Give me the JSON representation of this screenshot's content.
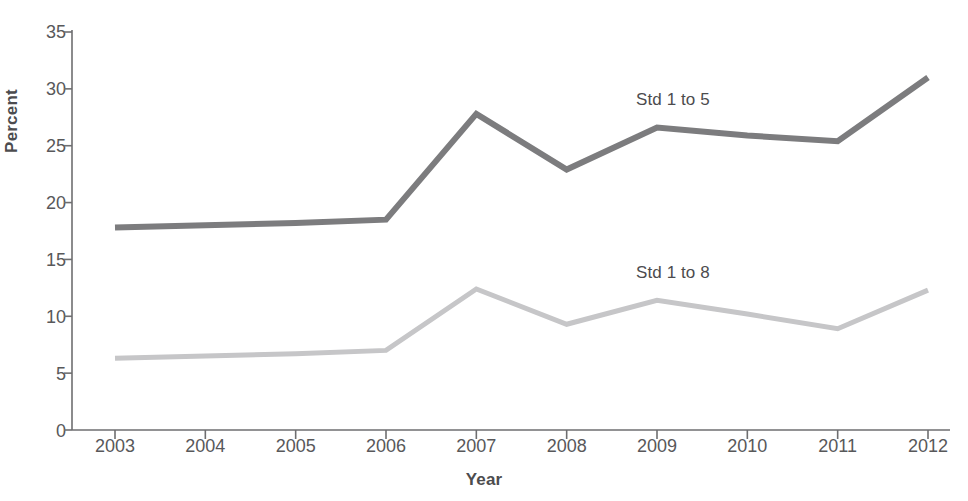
{
  "chart_data": {
    "type": "line",
    "title": "",
    "subtitle": "",
    "xlabel": "Year",
    "ylabel": "Percent",
    "x": [
      2003,
      2004,
      2005,
      2006,
      2007,
      2008,
      2009,
      2010,
      2011,
      2012
    ],
    "categories": [
      "2003",
      "2004",
      "2005",
      "2006",
      "2007",
      "2008",
      "2009",
      "2010",
      "2011",
      "2012"
    ],
    "xlim": [
      2003,
      2012
    ],
    "ylim": [
      0,
      35
    ],
    "y_ticks": [
      0,
      5,
      10,
      15,
      20,
      25,
      30,
      35
    ],
    "y_tick_labels": [
      "0",
      "5",
      "10",
      "15",
      "20",
      "25",
      "30",
      "35"
    ],
    "grid": false,
    "legend_position": "inline-annotation",
    "series": [
      {
        "name": "Std 1 to 5",
        "color": "#7c7c7e",
        "values": [
          17.8,
          18.0,
          18.2,
          18.5,
          27.8,
          22.9,
          26.6,
          25.9,
          25.4,
          31.0
        ]
      },
      {
        "name": "Std 1 to 8",
        "color": "#c6c6c8",
        "values": [
          6.3,
          6.5,
          6.7,
          7.0,
          12.4,
          9.3,
          11.4,
          10.2,
          8.9,
          12.3
        ]
      }
    ],
    "annotations": [
      {
        "text": "Std 1 to 5",
        "series": "Std 1 to 5"
      },
      {
        "text": "Std 1 to 8",
        "series": "Std 1 to 8"
      }
    ]
  },
  "axis": {
    "y_title": "Percent",
    "x_title": "Year",
    "axis_color": "#6e6e70"
  }
}
